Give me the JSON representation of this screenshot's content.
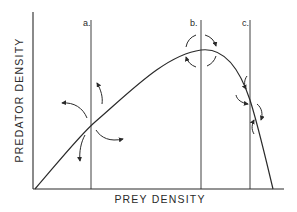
{
  "diagram": {
    "type": "predator-prey isocline diagram",
    "x_axis_label": "PREY DENSITY",
    "y_axis_label": "PREDATOR DENSITY",
    "prey_isocline": {
      "shape": "hump",
      "description": "Hump-shaped prey isocline rising from origin, peaking near line b, falling steeply to the prey axis beyond line c"
    },
    "predator_isoclines": [
      {
        "id": "a",
        "label": "a.",
        "stability_arrows": "spiral-outward (unstable)"
      },
      {
        "id": "b",
        "label": "b.",
        "stability_arrows": "neutral cycle (dashed circle around peak)"
      },
      {
        "id": "c",
        "label": "c.",
        "stability_arrows": "converging (stable)"
      }
    ]
  },
  "colors": {
    "ink": "#2a2a2a",
    "background": "#ffffff"
  }
}
